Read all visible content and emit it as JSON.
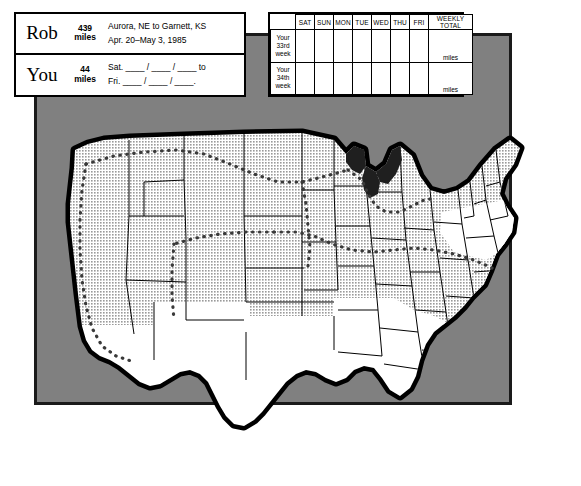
{
  "panel": {
    "background_color": "#808080",
    "border_color": "#1a1a1a"
  },
  "info_box": {
    "rows": [
      {
        "who": "Rob",
        "distance_number": "439",
        "distance_unit": "miles",
        "line1": "Aurora, NE to Garnett, KS",
        "line2": "Apr. 20–May 3, 1985"
      },
      {
        "who": "You",
        "distance_number": "44",
        "distance_unit": "miles",
        "line1": "Sat. ____ / ____ / ____ to",
        "line2": "Fri. ____ / ____ / ____."
      }
    ]
  },
  "log_table": {
    "columns": [
      "SAT",
      "SUN",
      "MON",
      "TUE",
      "WED",
      "THU",
      "FRI",
      "WEEKLY TOTAL"
    ],
    "rows": [
      {
        "label_lines": [
          "Your",
          "33rd",
          "week"
        ],
        "values": [
          "",
          "",
          "",
          "",
          "",
          "",
          ""
        ],
        "total": "",
        "total_unit": "miles"
      },
      {
        "label_lines": [
          "Your",
          "34th",
          "week"
        ],
        "values": [
          "",
          "",
          "",
          "",
          "",
          "",
          ""
        ],
        "total": "",
        "total_unit": "miles"
      }
    ]
  },
  "map": {
    "title": "United States outline map",
    "shaded_fill": "#c9c9c9",
    "unshaded_fill": "#ffffff",
    "coast_color": "#000000",
    "route_style": "dotted",
    "route_color": "#3a3a3a",
    "route_from": "Aurora, NE",
    "route_to": "Garnett, KS"
  }
}
